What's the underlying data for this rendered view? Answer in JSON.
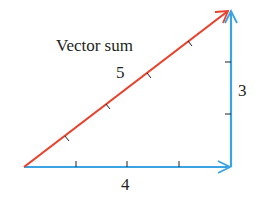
{
  "diagram": {
    "title": "Vector sum",
    "labels": {
      "sum_magnitude": "5",
      "vertical_magnitude": "3",
      "horizontal_magnitude": "4"
    },
    "colors": {
      "sum_vector": "#e8412c",
      "component_vectors": "#3aa3e3",
      "text": "#231f20"
    },
    "vectors": [
      {
        "name": "horizontal",
        "magnitude": 4,
        "from": [
          0,
          0
        ],
        "to": [
          4,
          0
        ]
      },
      {
        "name": "vertical",
        "magnitude": 3,
        "from": [
          4,
          0
        ],
        "to": [
          4,
          3
        ]
      },
      {
        "name": "sum",
        "magnitude": 5,
        "from": [
          0,
          0
        ],
        "to": [
          4,
          3
        ]
      }
    ]
  }
}
